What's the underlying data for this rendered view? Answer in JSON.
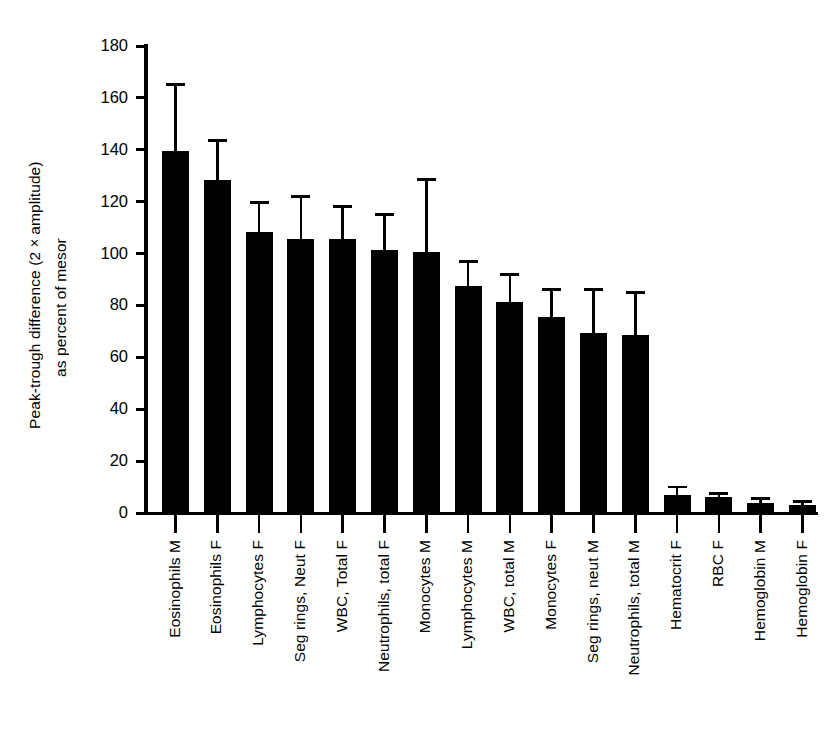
{
  "chart_data": {
    "type": "bar",
    "title": "",
    "xlabel": "",
    "ylabel": "Peak-trough difference (2×amplitude) as percent of mesor",
    "ylabel_line1": "Peak-trough difference (2×amplitude)",
    "ylabel_line2": "as percent of mesor",
    "ylim": [
      0,
      180
    ],
    "ytick_step": 20,
    "ytick_labels": [
      "180",
      "160",
      "140",
      "120",
      "100",
      "80",
      "60",
      "40",
      "20",
      "0"
    ],
    "ytick_values": [
      180,
      160,
      140,
      120,
      100,
      80,
      60,
      40,
      20,
      0
    ],
    "grid": false,
    "legend": "none",
    "error_bars": "upper only (SEM/SD)",
    "bar_color": "#000000",
    "categories": [
      "Eosinophils M",
      "Eosinophils F",
      "Lymphocytes F",
      "Seg rings, Neut F",
      "WBC, Total F",
      "Neutrophils, total F",
      "Monocytes M",
      "Lymphocytes M",
      "WBC, total M",
      "Monocytes F",
      "Seg rings, neut M",
      "Neutrophils, total M",
      "Hematocrit F",
      "RBC F",
      "Hemoglobin M",
      "Hemoglobin F"
    ],
    "values": [
      139.5,
      128.5,
      108.5,
      105.5,
      105.5,
      101.5,
      100.5,
      87.5,
      81.5,
      75.5,
      69.5,
      68.5,
      7.0,
      6.0,
      4.0,
      3.0
    ],
    "error_upper": [
      164.5,
      143.0,
      119.0,
      121.5,
      117.5,
      114.5,
      128.0,
      96.5,
      91.5,
      85.5,
      85.5,
      84.5,
      9.5,
      7.0,
      5.0,
      4.0
    ],
    "series": [
      {
        "name": "Peak-trough difference",
        "values": [
          139.5,
          128.5,
          108.5,
          105.5,
          105.5,
          101.5,
          100.5,
          87.5,
          81.5,
          75.5,
          69.5,
          68.5,
          7.0,
          6.0,
          4.0,
          3.0
        ]
      }
    ]
  }
}
